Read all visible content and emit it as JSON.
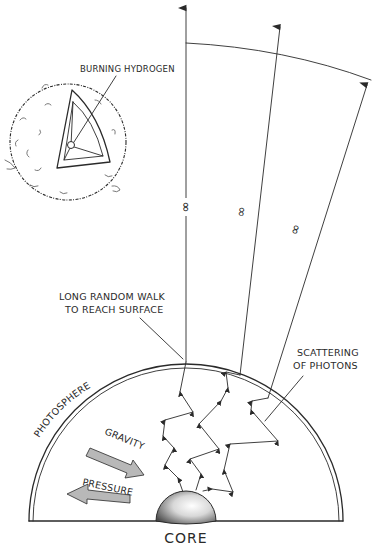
{
  "diagram": {
    "inset": {
      "label_burning_hydrogen": "BURNING HYDROGEN"
    },
    "labels": {
      "long_random_walk_line1": "LONG RANDOM WALK",
      "long_random_walk_line2": "TO REACH SURFACE",
      "scattering_line1": "SCATTERING",
      "scattering_line2": "OF PHOTONS",
      "photosphere": "PHOTOSPHERE",
      "gravity": "GRAVITY",
      "pressure": "PRESSURE",
      "core": "CORE"
    },
    "break_symbol": "∞",
    "colors": {
      "ink": "#2a2a2a",
      "arrow_fill": "#b8b8b8",
      "core_light": "#ffffff",
      "core_dark": "#555555",
      "background": "#ffffff"
    },
    "rays": [
      {
        "name": "ray-vertical",
        "from": [
          186,
          362
        ],
        "to": [
          186,
          5
        ]
      },
      {
        "name": "ray-middle",
        "from": [
          240,
          375
        ],
        "to": [
          280,
          24
        ]
      },
      {
        "name": "ray-right",
        "from": [
          268,
          398
        ],
        "to": [
          368,
          82
        ]
      }
    ]
  }
}
